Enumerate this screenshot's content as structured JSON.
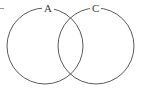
{
  "figure": {
    "type": "venn-diagram",
    "width": 141,
    "height": 92,
    "background_color": "#ffffff",
    "stroke_color": "#5a5a5a",
    "stroke_width": 1,
    "fill": "none",
    "labels": {
      "left_set": "A",
      "right_set": "C"
    },
    "circles": [
      {
        "name": "set-a-circle",
        "label": "A",
        "cx": 45,
        "cy": 46,
        "r": 38
      },
      {
        "name": "set-c-circle",
        "label": "C",
        "cx": 96,
        "cy": 46,
        "r": 38
      }
    ],
    "intersection_points": [
      {
        "x": 72,
        "y": 10
      },
      {
        "x": 72,
        "y": 81
      }
    ],
    "artifact_mark": "edge-dash"
  }
}
